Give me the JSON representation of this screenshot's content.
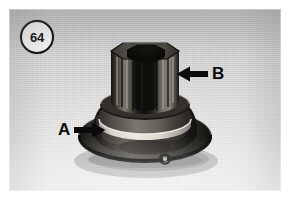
{
  "figure": {
    "number": "64",
    "badge_name": "figure-number-badge",
    "caption": ""
  },
  "photo": {
    "type": "black-and-white photograph",
    "subject": "splined hub with conical flange base",
    "background_color": "#d9dada",
    "ink_color": "#0b0b0b"
  },
  "callouts": [
    {
      "id": "A",
      "label": "A",
      "arrow_direction": "right",
      "points_at": "flange base rim"
    },
    {
      "id": "B",
      "label": "B",
      "arrow_direction": "left",
      "points_at": "splined shaft"
    }
  ]
}
